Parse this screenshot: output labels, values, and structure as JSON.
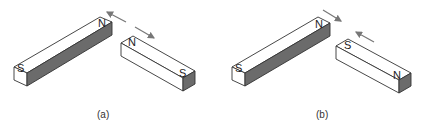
{
  "figure": {
    "panels": [
      {
        "caption": "(a)",
        "magnet_left": {
          "end_near": "S",
          "end_far": "N"
        },
        "magnet_right": {
          "end_near": "N",
          "end_far": "S"
        },
        "arrows": "repel (pointing apart)"
      },
      {
        "caption": "(b)",
        "magnet_left": {
          "end_near": "S",
          "end_far": "N"
        },
        "magnet_right": {
          "end_near": "S",
          "end_far": "N"
        },
        "arrows": "attract (pointing together)"
      }
    ],
    "colors": {
      "face": "#ffffff",
      "dark_side": "#6b6b6b",
      "edge": "#333333",
      "arrow": "#777777"
    }
  }
}
